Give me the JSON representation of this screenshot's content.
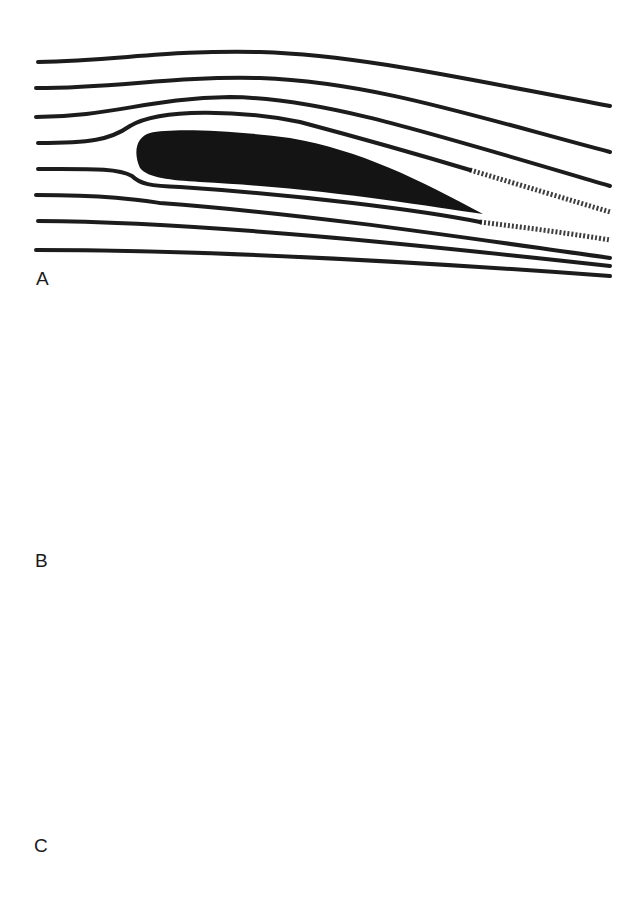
{
  "figure": {
    "panels": [
      {
        "id": "A",
        "label": "A",
        "description": "Smooth attached flow around airfoil at low angle of attack; thin turbulent wake behind trailing edge",
        "streamline_count": 8
      },
      {
        "id": "B",
        "label": "B",
        "description": "Airfoil at high angle of attack; flow separation over upper surface with large turbulent wake (stall)",
        "streamline_count": 8
      },
      {
        "id": "C",
        "label": "C",
        "description": "Airfoil with leading-edge slat at high angle of attack; flow remains attached, narrow turbulent wake",
        "streamline_count": 8
      }
    ],
    "colors": {
      "ink": "#1c1c1c",
      "background": "#ffffff"
    }
  }
}
